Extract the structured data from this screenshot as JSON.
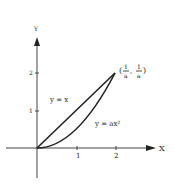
{
  "diagram": {
    "axes": {
      "x_label": "X",
      "y_label": "Y",
      "x_ticks": [
        "1",
        "2"
      ],
      "y_ticks": [
        "1",
        "2"
      ]
    },
    "curves": [
      {
        "label": "y = x",
        "type": "line"
      },
      {
        "label": "y = ax²",
        "type": "parabola"
      }
    ],
    "point": {
      "label_open": "(",
      "num1": "1",
      "den1": "a",
      "comma": ",",
      "num2": "1",
      "den2": "a",
      "label_close": ")"
    },
    "colors": {
      "ink": "#222222",
      "background": "#ffffff"
    }
  }
}
